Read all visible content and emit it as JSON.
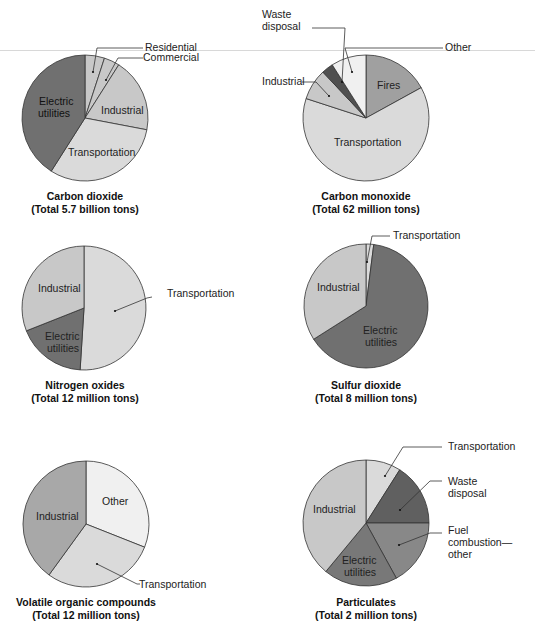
{
  "chart_data": [
    {
      "type": "pie",
      "id": "co2",
      "title": "Carbon dioxide",
      "subtitle": "(Total 5.7 billion tons)",
      "center": [
        85,
        118
      ],
      "radius": 63,
      "slices": [
        {
          "label": "Residential",
          "value": 5,
          "color": "#c8c8c8",
          "label_mode": "callout"
        },
        {
          "label": "Commercial",
          "value": 4,
          "color": "#c8c8c8",
          "label_mode": "callout"
        },
        {
          "label": "Industrial",
          "value": 19,
          "color": "#c8c8c8",
          "label_mode": "inside"
        },
        {
          "label": "Transportation",
          "value": 31,
          "color": "#dadada",
          "label_mode": "inside"
        },
        {
          "label": "Electric utilities",
          "value": 41,
          "color": "#707070",
          "label_mode": "inside"
        }
      ]
    },
    {
      "type": "pie",
      "id": "co",
      "title": "Carbon monoxide",
      "subtitle": "(Total 62 million tons)",
      "center": [
        366,
        118
      ],
      "radius": 63,
      "slices": [
        {
          "label": "Fires",
          "value": 17,
          "color": "#a0a0a0",
          "label_mode": "inside"
        },
        {
          "label": "Transportation",
          "value": 63,
          "color": "#dadada",
          "label_mode": "inside"
        },
        {
          "label": "Industrial",
          "value": 8,
          "color": "#c8c8c8",
          "label_mode": "callout"
        },
        {
          "label": "Waste disposal",
          "value": 3,
          "color": "#505050",
          "label_mode": "callout"
        },
        {
          "label": "Other",
          "value": 9,
          "color": "#f0f0f0",
          "label_mode": "callout"
        }
      ]
    },
    {
      "type": "pie",
      "id": "nox",
      "title": "Nitrogen oxides",
      "subtitle": "(Total 12 million tons)",
      "center": [
        84,
        308
      ],
      "radius": 62,
      "slices": [
        {
          "label": "Transportation",
          "value": 51,
          "color": "#dadada",
          "label_mode": "callout"
        },
        {
          "label": "Electric utilities",
          "value": 18,
          "color": "#707070",
          "label_mode": "inside"
        },
        {
          "label": "Industrial",
          "value": 31,
          "color": "#c8c8c8",
          "label_mode": "inside"
        }
      ]
    },
    {
      "type": "pie",
      "id": "so2",
      "title": "Sulfur dioxide",
      "subtitle": "(Total 8 million tons)",
      "center": [
        366,
        306
      ],
      "radius": 62,
      "slices": [
        {
          "label": "Transportation",
          "value": 2,
          "color": "#dadada",
          "label_mode": "callout"
        },
        {
          "label": "Electric utilities",
          "value": 64,
          "color": "#707070",
          "label_mode": "inside"
        },
        {
          "label": "Industrial",
          "value": 34,
          "color": "#c8c8c8",
          "label_mode": "inside"
        }
      ]
    },
    {
      "type": "pie",
      "id": "voc",
      "title": "Volatile organic compounds",
      "subtitle": "(Total 12 million tons)",
      "center": [
        86,
        524
      ],
      "radius": 63,
      "slices": [
        {
          "label": "Other",
          "value": 31,
          "color": "#f0f0f0",
          "label_mode": "inside"
        },
        {
          "label": "Transportation",
          "value": 29,
          "color": "#dadada",
          "label_mode": "callout"
        },
        {
          "label": "Industrial",
          "value": 40,
          "color": "#a8a8a8",
          "label_mode": "inside"
        }
      ]
    },
    {
      "type": "pie",
      "id": "particulates",
      "title": "Particulates",
      "subtitle": "(Total 2 million tons)",
      "center": [
        366,
        523
      ],
      "radius": 63,
      "slices": [
        {
          "label": "Transportation",
          "value": 9,
          "color": "#dadada",
          "label_mode": "callout"
        },
        {
          "label": "Waste disposal",
          "value": 16,
          "color": "#606060",
          "label_mode": "callout"
        },
        {
          "label": "Fuel combustion—other",
          "value": 17,
          "color": "#888888",
          "label_mode": "callout"
        },
        {
          "label": "Electric utilities",
          "value": 19,
          "color": "#787878",
          "label_mode": "inside"
        },
        {
          "label": "Industrial",
          "value": 39,
          "color": "#c8c8c8",
          "label_mode": "inside"
        }
      ]
    }
  ],
  "labels": {
    "co2": {
      "residential": "Residential",
      "commercial": "Commercial",
      "industrial": "Industrial",
      "transportation": "Transportation",
      "electric_1": "Electric",
      "electric_2": "utilities"
    },
    "co": {
      "waste_1": "Waste",
      "waste_2": "disposal",
      "other": "Other",
      "industrial": "Industrial",
      "fires": "Fires",
      "transportation": "Transportation"
    },
    "nox": {
      "industrial": "Industrial",
      "electric_1": "Electric",
      "electric_2": "utilities",
      "transportation": "Transportation"
    },
    "so2": {
      "transportation": "Transportation",
      "industrial": "Industrial",
      "electric_1": "Electric",
      "electric_2": "utilities"
    },
    "voc": {
      "other": "Other",
      "industrial": "Industrial",
      "transportation": "Transportation"
    },
    "particulates": {
      "transportation": "Transportation",
      "waste_1": "Waste",
      "waste_2": "disposal",
      "fuel_1": "Fuel",
      "fuel_2": "combustion—",
      "fuel_3": "other",
      "industrial": "Industrial",
      "electric_1": "Electric",
      "electric_2": "utilities"
    }
  },
  "titles": {
    "co2": {
      "title": "Carbon dioxide",
      "subtitle": "(Total 5.7 billion tons)"
    },
    "co": {
      "title": "Carbon monoxide",
      "subtitle": "(Total 62 million tons)"
    },
    "nox": {
      "title": "Nitrogen oxides",
      "subtitle": "(Total 12 million tons)"
    },
    "so2": {
      "title": "Sulfur dioxide",
      "subtitle": "(Total 8 million tons)"
    },
    "voc": {
      "title": "Volatile organic compounds",
      "subtitle": "(Total 12 million tons)"
    },
    "particulates": {
      "title": "Particulates",
      "subtitle": "(Total 2 million tons)"
    }
  }
}
